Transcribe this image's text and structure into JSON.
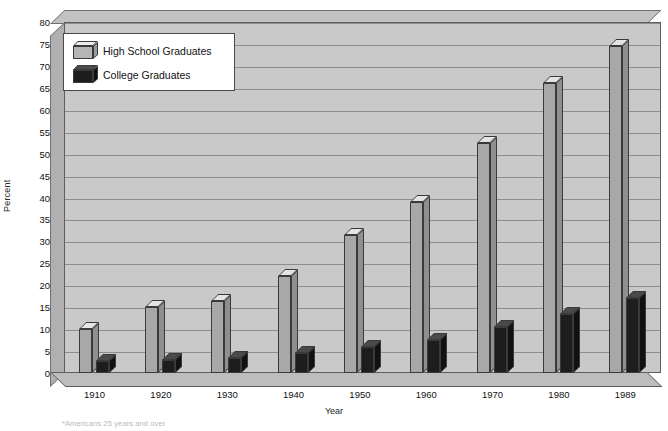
{
  "chart_data": {
    "type": "bar",
    "title": "",
    "xlabel": "Year",
    "ylabel": "Percent",
    "ylim": [
      0,
      80
    ],
    "ytick_step": 5,
    "yticks": [
      0,
      5,
      10,
      15,
      20,
      25,
      30,
      35,
      40,
      45,
      50,
      55,
      60,
      65,
      70,
      75,
      80
    ],
    "grid": true,
    "legend_position": "upper-left-inside",
    "categories": [
      "1910",
      "1920",
      "1930",
      "1940",
      "1950",
      "1960",
      "1970",
      "1980",
      "1989"
    ],
    "series": [
      {
        "name": "High School Graduates",
        "color": "#a8a8a8",
        "values": [
          10,
          15,
          16.5,
          22,
          31.5,
          39,
          52.5,
          66,
          74.5
        ]
      },
      {
        "name": "College Graduates",
        "color": "#1d1d1d",
        "values": [
          2.7,
          3,
          3.5,
          4.5,
          6,
          7.5,
          10.5,
          13.5,
          17
        ]
      }
    ],
    "footnote": "*Americans 25 years and over"
  },
  "legend": {
    "items": [
      {
        "label": "High School Graduates"
      },
      {
        "label": "College Graduates"
      }
    ]
  }
}
